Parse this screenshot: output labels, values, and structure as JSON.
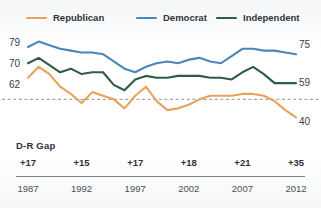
{
  "meta": {
    "cut_off_title": "",
    "background": "#ffffff"
  },
  "legend": {
    "position": "top",
    "items": [
      {
        "label": "Republican",
        "color": "#e9a25c",
        "name": "legend-republican"
      },
      {
        "label": "Democrat",
        "color": "#4a86b8",
        "name": "legend-democrat"
      },
      {
        "label": "Independent",
        "color": "#2f5d44",
        "name": "legend-independent"
      }
    ]
  },
  "axis": {
    "left_labels": [
      "79",
      "70",
      "62"
    ],
    "right_labels": [
      "75",
      "59",
      "40"
    ]
  },
  "gap": {
    "title": "D-R Gap",
    "values": [
      "+17",
      "+15",
      "+17",
      "+18",
      "+21",
      "+35"
    ]
  },
  "years": [
    "1987",
    "1992",
    "1997",
    "2002",
    "2007",
    "2012"
  ],
  "chart_data": {
    "type": "line",
    "title": "",
    "subtitle": "",
    "xlabel": "",
    "ylabel": "",
    "xlim": [
      1987,
      2012
    ],
    "ylim": [
      33,
      84
    ],
    "grid": false,
    "legend_position": "top",
    "reference_line": {
      "value": 50,
      "style": "dashed",
      "color": "#8d9399"
    },
    "x": [
      1987,
      1988,
      1989,
      1990,
      1991,
      1992,
      1993,
      1994,
      1995,
      1996,
      1997,
      1998,
      1999,
      2000,
      2001,
      2002,
      2003,
      2004,
      2005,
      2006,
      2007,
      2008,
      2009,
      2010,
      2011,
      2012
    ],
    "series": [
      {
        "name": "Republican",
        "color": "#e9a25c",
        "start_value": 62,
        "end_value": 40,
        "values": [
          62,
          68,
          64,
          57,
          53,
          48,
          54,
          52,
          50,
          45,
          52,
          57,
          49,
          44,
          45,
          47,
          50,
          52,
          52,
          52,
          53,
          53,
          52,
          49,
          44,
          40
        ]
      },
      {
        "name": "Democrat",
        "color": "#4a86b8",
        "start_value": 79,
        "end_value": 75,
        "values": [
          79,
          82,
          80,
          78,
          77,
          76,
          76,
          75,
          71,
          67,
          65,
          68,
          70,
          71,
          70,
          72,
          73,
          71,
          70,
          74,
          78,
          78,
          77,
          77,
          76,
          75
        ]
      },
      {
        "name": "Independent",
        "color": "#2f5d44",
        "start_value": 70,
        "end_value": 59,
        "values": [
          70,
          73,
          69,
          65,
          67,
          64,
          65,
          65,
          58,
          55,
          61,
          63,
          62,
          62,
          63,
          63,
          63,
          62,
          62,
          61,
          65,
          68,
          64,
          59,
          59,
          59
        ]
      }
    ]
  }
}
